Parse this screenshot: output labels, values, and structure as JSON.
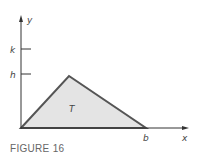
{
  "figure": {
    "caption": "FIGURE 16",
    "region_label": "T",
    "axes": {
      "x_label": "x",
      "y_label": "y"
    },
    "ticks": {
      "y": [
        "k",
        "h"
      ],
      "x": [
        "b"
      ]
    },
    "triangle": {
      "vertices": [
        [
          0,
          0
        ],
        [
          "apex_x",
          "h"
        ],
        [
          "b",
          0
        ]
      ],
      "fill": "#e4e4e4",
      "stroke": "#555555"
    }
  }
}
